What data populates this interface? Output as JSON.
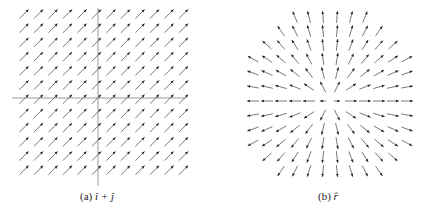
{
  "figure": {
    "panels": [
      {
        "id": "a",
        "caption_label": "(a)",
        "caption_math": "î + ĵ",
        "field": "uniform",
        "direction": [
          1,
          1
        ],
        "axes": {
          "cx": 98,
          "cy": 98,
          "x0": 12,
          "x1": 186,
          "y0": 8,
          "y1": 186,
          "color": "#999999"
        },
        "grid": {
          "x_start": 24,
          "x_step": 14.5,
          "cols": 12,
          "y_start": 14,
          "y_step": 14.2,
          "rows": 12
        },
        "arrow_len": 13
      },
      {
        "id": "b",
        "caption_label": "(b)",
        "caption_math": "r̂",
        "field": "radial",
        "center": [
          330,
          101
        ],
        "grid": {
          "x_start": 253,
          "x_step": 14,
          "cols": 12,
          "y_start": 17,
          "y_step": 14,
          "rows": 12,
          "radius": 92
        },
        "arrow_len": 12
      }
    ],
    "arrow_color": "#555555",
    "arrowhead_color": "#222222"
  },
  "captions": {
    "a": {
      "label": "(a)",
      "math": "î + ĵ"
    },
    "b": {
      "label": "(b)",
      "math": "r̂"
    }
  }
}
